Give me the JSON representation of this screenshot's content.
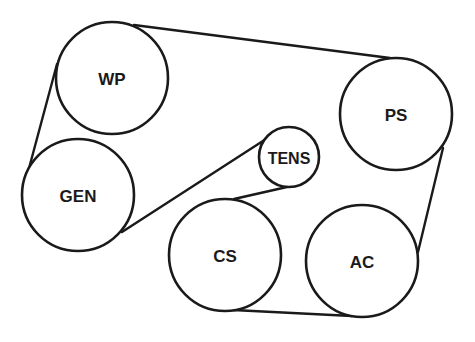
{
  "diagram": {
    "title": "",
    "type": "serpentine belt routing",
    "pulleys": [
      {
        "id": "wp",
        "label": "WP",
        "cx": 112,
        "cy": 78,
        "r": 56
      },
      {
        "id": "gen",
        "label": "GEN",
        "cx": 78,
        "cy": 195,
        "r": 56
      },
      {
        "id": "tens",
        "label": "TENS",
        "cx": 289,
        "cy": 157,
        "r": 30
      },
      {
        "id": "ps",
        "label": "PS",
        "cx": 396,
        "cy": 114,
        "r": 56
      },
      {
        "id": "cs",
        "label": "CS",
        "cx": 225,
        "cy": 255,
        "r": 56
      },
      {
        "id": "ac",
        "label": "AC",
        "cx": 362,
        "cy": 261,
        "r": 56
      }
    ],
    "belt_segments": [
      {
        "from": "WP",
        "to": "PS"
      },
      {
        "from": "WP",
        "to": "GEN"
      },
      {
        "from": "GEN",
        "to": "TENS"
      },
      {
        "from": "TENS",
        "to": "CS"
      },
      {
        "from": "CS",
        "to": "AC"
      },
      {
        "from": "AC",
        "to": "PS"
      }
    ]
  }
}
